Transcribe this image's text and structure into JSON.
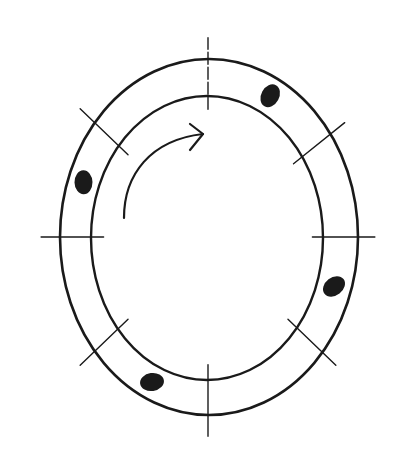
{
  "diagram": {
    "colors": {
      "ink": "#1a1a1a",
      "background": "#ffffff"
    },
    "ring": {
      "sections": 6,
      "division_marks": [
        {
          "id": "top",
          "angle_deg": 90
        },
        {
          "id": "upper-right",
          "angle_deg": 35
        },
        {
          "id": "right",
          "angle_deg": 0
        },
        {
          "id": "lower-right",
          "angle_deg": -40
        },
        {
          "id": "bottom",
          "angle_deg": -90
        },
        {
          "id": "lower-left",
          "angle_deg": -140
        },
        {
          "id": "left",
          "angle_deg": 180
        },
        {
          "id": "upper-left",
          "angle_deg": 140
        }
      ],
      "markers": [
        {
          "id": "marker-upper-right",
          "angle_deg": 62
        },
        {
          "id": "marker-left",
          "angle_deg": 160
        },
        {
          "id": "marker-right",
          "angle_deg": -18
        },
        {
          "id": "marker-bottom-left",
          "angle_deg": -115
        }
      ]
    },
    "direction_arrow": {
      "direction": "clockwise",
      "icon": "curved-arrow-right-icon"
    }
  }
}
